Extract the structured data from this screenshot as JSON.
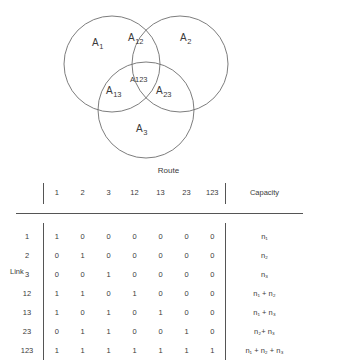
{
  "figure": {
    "venn": {
      "caption": "Route",
      "regions": [
        {
          "id": "A1",
          "base": "A",
          "sub": "1",
          "x": 96,
          "y": 44
        },
        {
          "id": "A12",
          "base": "A",
          "sub": "12",
          "x": 132,
          "y": 40
        },
        {
          "id": "A2",
          "base": "A",
          "sub": "2",
          "x": 183,
          "y": 41
        },
        {
          "id": "A123",
          "base": "A123",
          "sub": "",
          "x": 140,
          "y": 80
        },
        {
          "id": "A13",
          "base": "A",
          "sub": "13",
          "x": 113,
          "y": 92
        },
        {
          "id": "A23",
          "base": "A",
          "sub": "23",
          "x": 162,
          "y": 92
        },
        {
          "id": "A3",
          "base": "A",
          "sub": "3",
          "x": 140,
          "y": 130
        }
      ],
      "circles": [
        {
          "id": "circle-route-1",
          "cx": 112,
          "cy": 64,
          "r": 48
        },
        {
          "id": "circle-route-2",
          "cx": 180,
          "cy": 64,
          "r": 48
        },
        {
          "id": "circle-route-3",
          "cx": 146,
          "cy": 110,
          "r": 48
        }
      ]
    },
    "table": {
      "group_header": "Route",
      "row_axis_label": "Link",
      "corner_label": "",
      "route_columns": [
        "1",
        "2",
        "3",
        "12",
        "13",
        "23",
        "123"
      ],
      "capacity_header": "Capacity",
      "rows": [
        {
          "link": "1",
          "bits": [
            "1",
            "0",
            "0",
            "0",
            "0",
            "0",
            "0"
          ],
          "capacity": "n₁"
        },
        {
          "link": "2",
          "bits": [
            "0",
            "1",
            "0",
            "0",
            "0",
            "0",
            "0"
          ],
          "capacity": "n₂"
        },
        {
          "link": "3",
          "bits": [
            "0",
            "0",
            "1",
            "0",
            "0",
            "0",
            "0"
          ],
          "capacity": "n₃"
        },
        {
          "link": "12",
          "bits": [
            "1",
            "1",
            "0",
            "1",
            "0",
            "0",
            "0"
          ],
          "capacity": "n₁ + n₂"
        },
        {
          "link": "13",
          "bits": [
            "1",
            "0",
            "1",
            "0",
            "1",
            "0",
            "0"
          ],
          "capacity": "n₁ + n₃"
        },
        {
          "link": "23",
          "bits": [
            "0",
            "1",
            "1",
            "0",
            "0",
            "1",
            "0"
          ],
          "capacity": "n₂+ n₃"
        },
        {
          "link": "123",
          "bits": [
            "1",
            "1",
            "1",
            "1",
            "1",
            "1",
            "1"
          ],
          "capacity": "n₁ + n₂ + n₃"
        }
      ]
    }
  },
  "colors": {
    "stroke": "#6e6e6e",
    "rule": "#555555",
    "text": "#3a3a3a",
    "background": "#ffffff"
  }
}
